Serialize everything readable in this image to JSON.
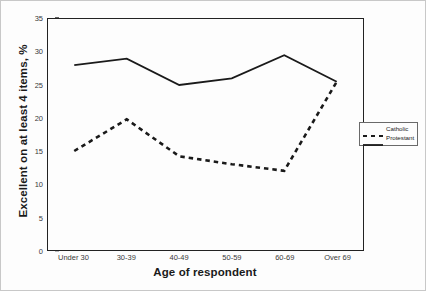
{
  "chart_data": {
    "type": "line",
    "title": "",
    "xlabel": "Age of respondent",
    "ylabel": "Excellent on at least 4 items, %",
    "categories": [
      "Under 30",
      "30-39",
      "40-49",
      "50-59",
      "60-69",
      "Over 69"
    ],
    "ylim": [
      0,
      35
    ],
    "yticks": [
      0,
      5,
      10,
      15,
      20,
      25,
      30,
      35
    ],
    "ytick_labels": [
      "0",
      "5",
      "10",
      "15",
      "20",
      "25",
      "30",
      "35"
    ],
    "grid": false,
    "legend_position": "right-outside",
    "series": [
      {
        "name": "Catholic",
        "style": "dashed",
        "color": "#1a1a1a",
        "values": [
          15,
          19.8,
          14.2,
          13,
          12,
          25.5
        ]
      },
      {
        "name": "Protestant",
        "style": "solid",
        "color": "#1a1a1a",
        "values": [
          28,
          29,
          25,
          26,
          29.5,
          25.5
        ]
      }
    ]
  },
  "legend": {
    "items": [
      {
        "label": "Catholic",
        "style": "dashed"
      },
      {
        "label": "Protestant",
        "style": "solid"
      }
    ]
  }
}
